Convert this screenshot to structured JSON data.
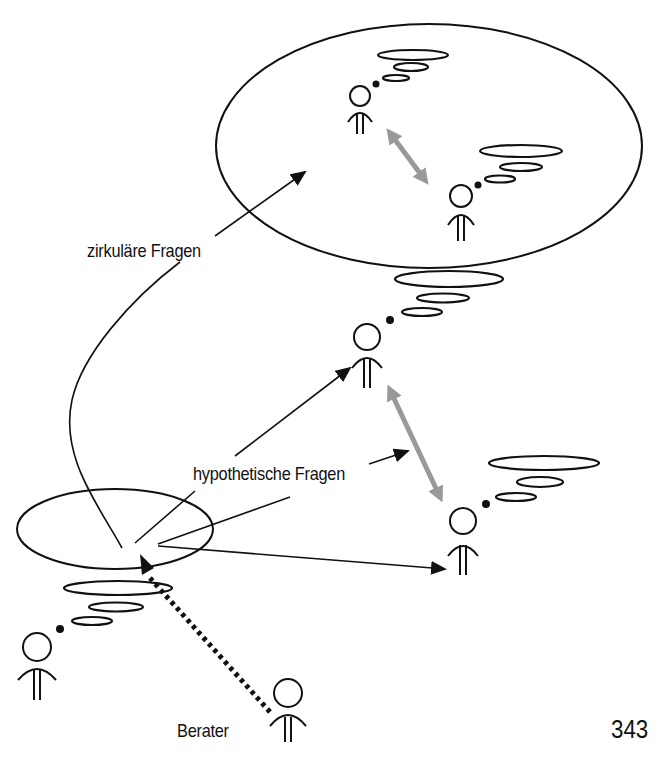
{
  "diagram": {
    "title_cut_off": "",
    "labels": {
      "circular_questions": "zirkuläre Fragen",
      "hypothetical_questions": "hypothetische Fragen",
      "advisor": "Berater"
    },
    "page_number": "343",
    "colors": {
      "line": "#111111",
      "interaction_arrow": "#999999",
      "background": "#ffffff"
    },
    "nodes": [
      {
        "id": "system-person-a",
        "role": "person in circular-question system (top)"
      },
      {
        "id": "system-person-b",
        "role": "person in circular-question system (bottom right of system)"
      },
      {
        "id": "person-middle",
        "role": "person targeted by hypothetical question"
      },
      {
        "id": "person-right",
        "role": "person targeted by hypothetical question"
      },
      {
        "id": "client",
        "role": "person at lower left with thought bubble"
      },
      {
        "id": "advisor",
        "role": "Berater"
      }
    ],
    "edges": [
      {
        "from": "question-origin",
        "to": "system-ellipse",
        "label": "zirkuläre Fragen",
        "style": "solid-arrow"
      },
      {
        "from": "question-origin",
        "to": "person-middle",
        "label": "hypothetische Fragen",
        "style": "solid-arrow"
      },
      {
        "from": "question-origin",
        "to": "between-middle-and-right",
        "label": "hypothetische Fragen",
        "style": "solid-arrow"
      },
      {
        "from": "question-origin",
        "to": "person-right",
        "style": "solid-arrow"
      },
      {
        "from": "advisor",
        "to": "question-origin",
        "style": "dotted-arrow"
      },
      {
        "from": "system-person-a",
        "to": "system-person-b",
        "style": "gray-double-arrow"
      },
      {
        "from": "person-middle",
        "to": "person-right",
        "style": "gray-double-arrow"
      }
    ]
  }
}
